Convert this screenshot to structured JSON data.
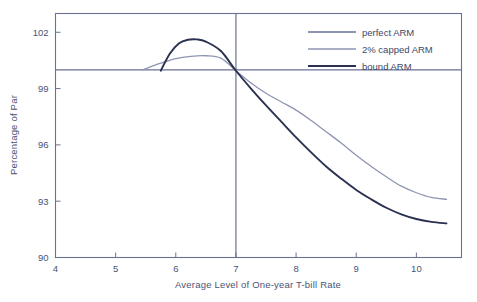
{
  "chart_data": {
    "type": "line",
    "title": "",
    "xlabel": "Average Level of One-year T-bill Rate",
    "ylabel": "Percentage of Par",
    "xlim": [
      4,
      10.75
    ],
    "ylim": [
      90,
      103
    ],
    "xticks": [
      4,
      5,
      6,
      7,
      8,
      9,
      10
    ],
    "xtick_labels": [
      "4",
      "5",
      "6",
      "7",
      "8",
      "9",
      "10"
    ],
    "yticks": [
      90,
      93,
      96,
      99,
      102
    ],
    "ytick_labels": [
      "90",
      "93",
      "96",
      "99",
      "102"
    ],
    "grid": false,
    "legend_position": "top-right",
    "reference_lines": {
      "horizontal_value": 100.0,
      "vertical_value": 7.0
    },
    "series": [
      {
        "name": "perfect ARM",
        "color": "#6a7193",
        "style": "horizontal-reference",
        "x": [
          4,
          10.75
        ],
        "values": [
          100.0,
          100.0
        ]
      },
      {
        "name": "2% capped ARM",
        "color": "#8e95b2",
        "style": "curve",
        "x": [
          5.45,
          5.75,
          6.0,
          6.25,
          6.5,
          6.75,
          7.0,
          7.25,
          7.5,
          7.75,
          8.0,
          8.25,
          8.5,
          8.75,
          9.0,
          9.25,
          9.5,
          9.75,
          10.0,
          10.25,
          10.5
        ],
        "values": [
          100.0,
          100.35,
          100.6,
          100.72,
          100.75,
          100.62,
          99.95,
          99.3,
          98.75,
          98.3,
          97.85,
          97.3,
          96.7,
          96.1,
          95.45,
          94.85,
          94.3,
          93.8,
          93.45,
          93.2,
          93.1
        ]
      },
      {
        "name": "bound ARM",
        "color": "#2a3050",
        "style": "curve",
        "x": [
          5.75,
          5.9,
          6.05,
          6.2,
          6.35,
          6.5,
          6.75,
          7.0,
          7.25,
          7.5,
          7.75,
          8.0,
          8.25,
          8.5,
          8.75,
          9.0,
          9.25,
          9.5,
          9.75,
          10.0,
          10.25,
          10.5
        ],
        "values": [
          99.95,
          100.85,
          101.4,
          101.6,
          101.62,
          101.5,
          101.0,
          99.95,
          99.0,
          98.1,
          97.25,
          96.4,
          95.6,
          94.85,
          94.2,
          93.6,
          93.1,
          92.65,
          92.3,
          92.05,
          91.9,
          91.82
        ]
      }
    ]
  },
  "legend": {
    "entries": [
      {
        "label": "perfect ARM"
      },
      {
        "label": "2% capped ARM"
      },
      {
        "label": "bound ARM"
      }
    ]
  },
  "colors": {
    "frame": "#6a7193",
    "text": "#4a5275",
    "perfect_arm": "#6a7193",
    "capped_arm": "#8e95b2",
    "bound_arm": "#2a3050",
    "background": "#ffffff"
  }
}
